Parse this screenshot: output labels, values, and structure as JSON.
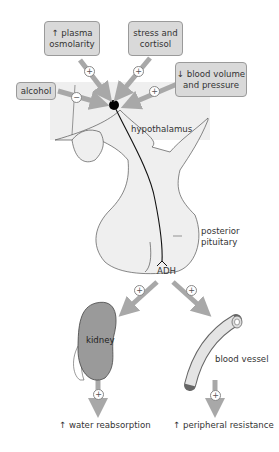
{
  "diagram": {
    "stimuli": [
      {
        "id": "plasma",
        "line1": "↑ plasma",
        "line2": "osmolarity",
        "effect": "+"
      },
      {
        "id": "stress",
        "line1": "stress and",
        "line2": "cortisol",
        "effect": "+"
      },
      {
        "id": "blood",
        "line1": "↓ blood volume",
        "line2": "and pressure",
        "effect": "+"
      },
      {
        "id": "alcohol",
        "line1": "alcohol",
        "line2": "",
        "effect": "−"
      }
    ],
    "labels": {
      "hypothalamus": "hypothalamus",
      "posterior": "posterior",
      "pituitary": "pituitary",
      "hormone": "ADH",
      "kidney": "kidney",
      "vessel": "blood vessel"
    },
    "targets": [
      {
        "organ": "kidney",
        "effect": "+",
        "outcome": "↑ water reabsorption"
      },
      {
        "organ": "blood vessel",
        "effect": "+",
        "outcome": "↑ peripheral resistance"
      }
    ],
    "colors": {
      "box_fill": "#d9d9d9",
      "arrow": "#a8a8a8",
      "brain_fill": "#efefef",
      "kidney_fill": "#9a9a9a"
    }
  }
}
